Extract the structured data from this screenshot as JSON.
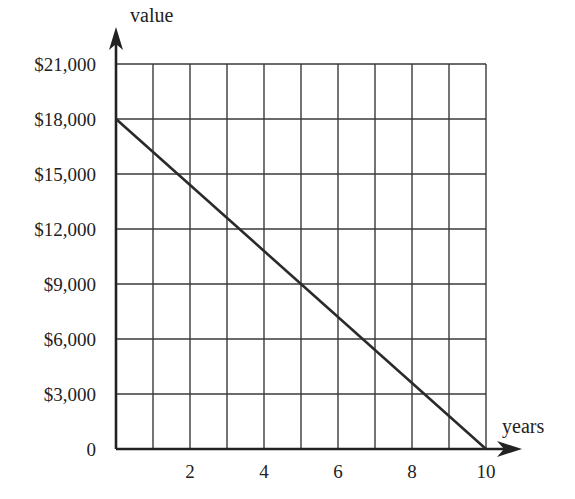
{
  "chart_data": {
    "type": "line",
    "title": "",
    "xlabel": "years",
    "ylabel": "value",
    "x_ticks": [
      "2",
      "4",
      "6",
      "8",
      "10"
    ],
    "y_ticks": [
      "0",
      "$3,000",
      "$6,000",
      "$9,000",
      "$12,000",
      "$15,000",
      "$18,000",
      "$21,000"
    ],
    "xlim": [
      0,
      10
    ],
    "ylim": [
      0,
      21000
    ],
    "grid": true,
    "grid_x_step": 1,
    "grid_y_step": 3000,
    "legend": null,
    "series": [
      {
        "name": "value",
        "x": [
          0,
          10
        ],
        "y": [
          18000,
          0
        ]
      }
    ]
  },
  "colors": {
    "line": "#2a2a2a",
    "grid": "#3a3a3a",
    "axis": "#222222",
    "text": "#222222",
    "background": "#ffffff"
  }
}
